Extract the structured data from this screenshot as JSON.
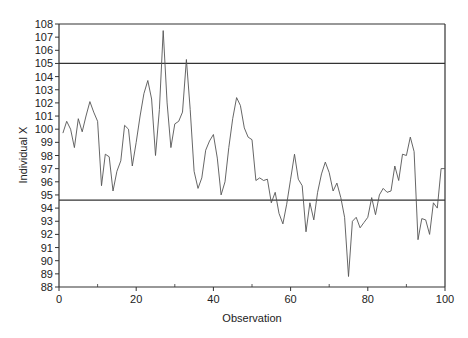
{
  "chart_data": {
    "type": "line",
    "title": "",
    "xlabel": "Observation",
    "ylabel": "Individual X",
    "xlim": [
      0,
      100
    ],
    "ylim": [
      88,
      108
    ],
    "x_ticks": [
      0,
      20,
      40,
      60,
      80,
      100
    ],
    "x_minor_ticks": [
      10,
      30,
      50,
      70,
      90
    ],
    "y_ticks": [
      88,
      89,
      90,
      91,
      92,
      93,
      94,
      95,
      96,
      97,
      98,
      99,
      100,
      101,
      102,
      103,
      104,
      105,
      106,
      107,
      108
    ],
    "grid": false,
    "legend": null,
    "reference_lines": [
      {
        "name": "UCL",
        "value": 105.0
      },
      {
        "name": "LCL",
        "value": 94.6
      }
    ],
    "series": [
      {
        "name": "Individual X",
        "x": [
          1,
          2,
          3,
          4,
          5,
          6,
          7,
          8,
          9,
          10,
          11,
          12,
          13,
          14,
          15,
          16,
          17,
          18,
          19,
          20,
          21,
          22,
          23,
          24,
          25,
          26,
          27,
          28,
          29,
          30,
          31,
          32,
          33,
          34,
          35,
          36,
          37,
          38,
          39,
          40,
          41,
          42,
          43,
          44,
          45,
          46,
          47,
          48,
          49,
          50,
          51,
          52,
          53,
          54,
          55,
          56,
          57,
          58,
          59,
          60,
          61,
          62,
          63,
          64,
          65,
          66,
          67,
          68,
          69,
          70,
          71,
          72,
          73,
          74,
          75,
          76,
          77,
          78,
          79,
          80,
          81,
          82,
          83,
          84,
          85,
          86,
          87,
          88,
          89,
          90,
          91,
          92,
          93,
          94,
          95,
          96,
          97,
          98,
          99,
          100
        ],
        "values": [
          99.7,
          100.6,
          100.0,
          98.6,
          100.8,
          99.8,
          101.0,
          102.1,
          101.3,
          100.6,
          95.7,
          98.1,
          97.9,
          95.3,
          96.8,
          97.6,
          100.3,
          100.0,
          97.2,
          99.0,
          101.0,
          102.7,
          103.7,
          102.3,
          98.0,
          101.5,
          107.5,
          102.0,
          98.6,
          100.4,
          100.6,
          101.3,
          105.3,
          101.5,
          96.8,
          95.5,
          96.3,
          98.4,
          99.1,
          99.6,
          97.8,
          95.0,
          96.0,
          98.6,
          100.8,
          102.4,
          101.8,
          100.1,
          99.4,
          99.2,
          96.1,
          96.3,
          96.1,
          96.2,
          94.4,
          95.2,
          93.6,
          92.8,
          94.3,
          96.2,
          98.1,
          96.2,
          95.7,
          92.2,
          94.4,
          93.1,
          95.2,
          96.6,
          97.5,
          96.7,
          95.3,
          95.9,
          94.8,
          93.3,
          88.8,
          93.0,
          93.3,
          92.5,
          92.9,
          93.3,
          94.8,
          93.5,
          95.0,
          95.5,
          95.2,
          95.3,
          97.2,
          96.1,
          98.1,
          98.0,
          99.4,
          98.3,
          91.6,
          93.2,
          93.1,
          92.0,
          94.4,
          94.0,
          97.0,
          97.0
        ]
      }
    ]
  },
  "axes": {
    "xlabel": "Observation",
    "ylabel": "Individual X"
  },
  "style": {
    "line_color": "#555555",
    "axis_color": "#333333",
    "control_line_color": "#333333"
  }
}
